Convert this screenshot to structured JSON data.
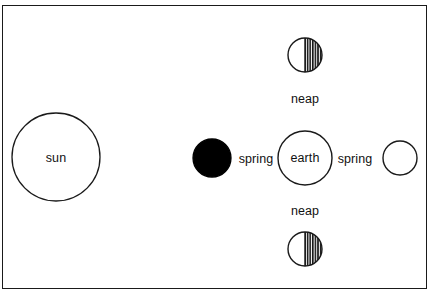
{
  "diagram": {
    "type": "astronomy-tide-diagram",
    "frame": {
      "border_color": "#1a1a1a",
      "background_color": "#ffffff"
    },
    "bodies": [
      {
        "id": "sun",
        "label": "sun",
        "shape": "circle",
        "fill": "#ffffff",
        "stroke": "#1a1a1a",
        "cx": 56,
        "cy": 157,
        "r": 44,
        "label_inside": true
      },
      {
        "id": "moon-new",
        "label": "",
        "shape": "circle",
        "fill": "#000000",
        "stroke": "#000000",
        "cx": 212,
        "cy": 158,
        "r": 19,
        "phase": "new-moon",
        "label_inside": false
      },
      {
        "id": "earth",
        "label": "earth",
        "shape": "circle",
        "fill": "#ffffff",
        "stroke": "#1a1a1a",
        "cx": 305,
        "cy": 158,
        "r": 27,
        "label_inside": true
      },
      {
        "id": "moon-full",
        "label": "",
        "shape": "circle",
        "fill": "#ffffff",
        "stroke": "#1a1a1a",
        "cx": 400,
        "cy": 158,
        "r": 17,
        "phase": "full-moon",
        "label_inside": false
      },
      {
        "id": "moon-quarter-top",
        "label": "",
        "shape": "half-hatched-circle",
        "fill": "#ffffff",
        "hatch_fill": "#111111",
        "stroke": "#1a1a1a",
        "cx": 305,
        "cy": 55,
        "r": 17,
        "phase": "quarter-moon",
        "label_inside": false
      },
      {
        "id": "moon-quarter-bottom",
        "label": "",
        "shape": "half-hatched-circle",
        "fill": "#ffffff",
        "hatch_fill": "#111111",
        "stroke": "#1a1a1a",
        "cx": 305,
        "cy": 249,
        "r": 17,
        "phase": "quarter-moon",
        "label_inside": false
      }
    ],
    "labels": [
      {
        "id": "label-sun",
        "text": "sun",
        "x": 56,
        "y": 158
      },
      {
        "id": "label-earth",
        "text": "earth",
        "x": 305,
        "y": 158
      },
      {
        "id": "label-spring-left",
        "text": "spring",
        "x": 256,
        "y": 159
      },
      {
        "id": "label-spring-right",
        "text": "spring",
        "x": 355,
        "y": 159
      },
      {
        "id": "label-neap-top",
        "text": "neap",
        "x": 305,
        "y": 99
      },
      {
        "id": "label-neap-bottom",
        "text": "neap",
        "x": 305,
        "y": 211
      }
    ],
    "colors": {
      "ink": "#1a1a1a",
      "text": "#111111",
      "background": "#ffffff",
      "shadow": "#000000"
    }
  }
}
